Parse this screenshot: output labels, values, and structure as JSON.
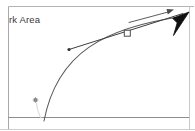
{
  "canvas": {
    "width": 195,
    "height": 131,
    "background": "#ffffff",
    "area_label": "rk Area",
    "border_color": "#a8a8a8",
    "axis_color": "#8d8d8d",
    "curve_color": "#5a5a5a",
    "vector_color": "#3d3d3d",
    "handle_fill": "#ffffff",
    "handle_stroke": "#4a4a4a",
    "cursor_color": "#111111",
    "trail_color": "#d8d8d8",
    "marker_color": "#6b6b6b"
  },
  "plot": {
    "type": "trajectory",
    "description": "projectile trajectory curve with tangent velocity vector",
    "curve": {
      "label": "trajectory-curve",
      "start": {
        "x": 44,
        "y": 120
      },
      "control_1": {
        "x": 58,
        "y": 54
      },
      "control_2": {
        "x": 104,
        "y": 27
      },
      "end": {
        "x": 185,
        "y": 17
      }
    },
    "tangent_line": {
      "label": "tangent-line",
      "from": {
        "x": 69,
        "y": 49
      },
      "to": {
        "x": 182,
        "y": 14
      }
    },
    "velocity_vector": {
      "label": "velocity-vector",
      "from": {
        "x": 129,
        "y": 22
      },
      "to": {
        "x": 174,
        "y": 10
      }
    },
    "drag_handle": {
      "label": "drag-handle",
      "x": 127,
      "y": 33,
      "size": 6
    },
    "origin_marker": {
      "label": "origin-marker",
      "x": 35,
      "y": 100
    },
    "tangent_endpoint_dot": {
      "label": "tangent-endpoint-dot",
      "x": 69,
      "y": 49
    },
    "launch_trail": {
      "label": "launch-trail",
      "from": {
        "x": 36,
        "y": 104
      },
      "to": {
        "x": 41,
        "y": 120
      }
    }
  },
  "cursor": {
    "label": "mouse-cursor",
    "tip": {
      "x": 188,
      "y": 13
    },
    "rotation_deg": 135
  },
  "axes": {
    "baseline_y": 117,
    "left_border_x": 8,
    "top_border_y": 6,
    "right_border_x": 189,
    "bottom_edge_y": 129
  }
}
